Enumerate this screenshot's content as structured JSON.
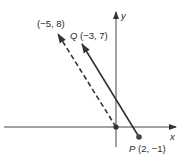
{
  "diagram": {
    "type": "vector-translation",
    "axes": {
      "x_label": "x",
      "y_label": "y"
    },
    "points": {
      "origin": {
        "coords": [
          0,
          0
        ]
      },
      "P": {
        "label": "P(2, −1)",
        "name": "P",
        "coords": [
          2,
          -1
        ]
      },
      "Q": {
        "label": "Q(−3, 7)",
        "name": "Q",
        "coords": [
          -3,
          7
        ]
      },
      "translated_tip": {
        "label": "(−5, 8)",
        "coords": [
          -5,
          8
        ]
      }
    },
    "vectors": [
      {
        "id": "PQ",
        "from": [
          2,
          -1
        ],
        "to": [
          -3,
          7
        ],
        "style": "solid"
      },
      {
        "id": "origin-vector",
        "from": [
          0,
          0
        ],
        "to": [
          -5,
          8
        ],
        "style": "dashed"
      }
    ],
    "colors": {
      "line": "#333333",
      "axis": "#444444",
      "background": "#ffffff"
    }
  }
}
